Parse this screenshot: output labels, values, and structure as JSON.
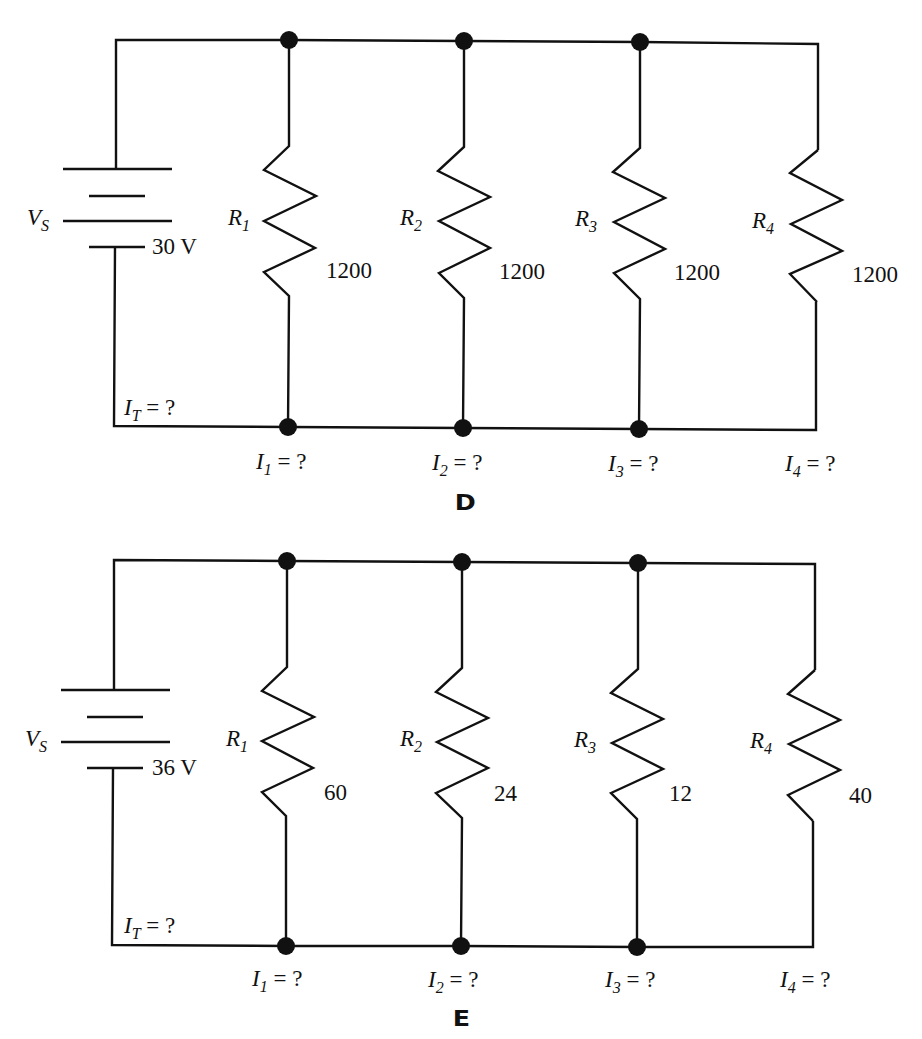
{
  "circuits": [
    {
      "figure_label": "D",
      "source": {
        "symbol": "V",
        "symbol_sub": "S",
        "value": "30 V"
      },
      "total_current": {
        "symbol": "I",
        "sub": "T",
        "text": " = ?"
      },
      "resistors": [
        {
          "name": "R",
          "sub": "1",
          "value": "1200",
          "current": {
            "symbol": "I",
            "sub": "1",
            "text": " = ?"
          }
        },
        {
          "name": "R",
          "sub": "2",
          "value": "1200",
          "current": {
            "symbol": "I",
            "sub": "2",
            "text": " = ?"
          }
        },
        {
          "name": "R",
          "sub": "3",
          "value": "1200",
          "current": {
            "symbol": "I",
            "sub": "3",
            "text": " = ?"
          }
        },
        {
          "name": "R",
          "sub": "4",
          "value": "1200",
          "current": {
            "symbol": "I",
            "sub": "4",
            "text": " = ?"
          }
        }
      ]
    },
    {
      "figure_label": "E",
      "source": {
        "symbol": "V",
        "symbol_sub": "S",
        "value": "36 V"
      },
      "total_current": {
        "symbol": "I",
        "sub": "T",
        "text": " = ?"
      },
      "resistors": [
        {
          "name": "R",
          "sub": "1",
          "value": "60",
          "current": {
            "symbol": "I",
            "sub": "1",
            "text": " = ?"
          }
        },
        {
          "name": "R",
          "sub": "2",
          "value": "24",
          "current": {
            "symbol": "I",
            "sub": "2",
            "text": " = ?"
          }
        },
        {
          "name": "R",
          "sub": "3",
          "value": "12",
          "current": {
            "symbol": "I",
            "sub": "3",
            "text": " = ?"
          }
        },
        {
          "name": "R",
          "sub": "4",
          "value": "40",
          "current": {
            "symbol": "I",
            "sub": "4",
            "text": " = ?"
          }
        }
      ]
    }
  ],
  "colors": {
    "ink": "#111111",
    "background": "#ffffff"
  }
}
